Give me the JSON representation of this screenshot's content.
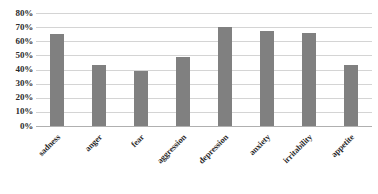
{
  "chart_data": {
    "type": "bar",
    "title": "",
    "subtitle": "",
    "xlabel": "",
    "ylabel": "",
    "categories": [
      "sadness",
      "anger",
      "fear",
      "aggression",
      "depression",
      "anxiety",
      "irritability",
      "appetite"
    ],
    "values": [
      65,
      43,
      39,
      49,
      70,
      67,
      66,
      43
    ],
    "value_suffix": "%",
    "ylim": [
      0,
      80
    ],
    "ytick_step": 10,
    "ytick_labels": [
      "80%",
      "70%",
      "60%",
      "50%",
      "40%",
      "30%",
      "20%",
      "10%",
      "0%"
    ],
    "ytick_values": [
      80,
      70,
      60,
      50,
      40,
      30,
      20,
      10,
      0
    ],
    "grid": true,
    "grid_axis": "y",
    "legend": false,
    "legend_position": "none",
    "bar_color": "#808080",
    "grid_color": "#d4d4d4",
    "axis_color": "#b0b0b0",
    "text_color": "#2c2c2c",
    "background": "#ffffff",
    "xlabel_rotation": -45
  }
}
